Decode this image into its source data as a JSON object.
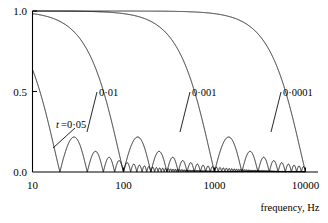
{
  "chart_data": {
    "type": "line",
    "title": "",
    "subtitle": "",
    "xlabel": "frequency, Hz",
    "ylabel": "",
    "xscale": "log",
    "xlim": [
      10,
      10000
    ],
    "ylim": [
      0.0,
      1.0
    ],
    "grid": false,
    "legend_position": "inline-annotations",
    "x_tick_labels": [
      "10",
      "100",
      "1000",
      "10000"
    ],
    "x_tick_values": [
      10,
      100,
      1000,
      10000
    ],
    "y_tick_labels": [
      "0.0",
      "0.5",
      "1.0"
    ],
    "y_tick_values": [
      0.0,
      0.5,
      1.0
    ],
    "annotations": [
      {
        "text": "t =0·05",
        "x": 30,
        "y": 0.3,
        "series": "0.05",
        "italic_prefix": "t"
      },
      {
        "text": "0·01",
        "x": 115,
        "y": 0.49,
        "series": "0.01"
      },
      {
        "text": "0·001",
        "x": 950,
        "y": 0.49,
        "series": "0.001"
      },
      {
        "text": "0·0001",
        "x": 8500,
        "y": 0.49,
        "series": "0.0001"
      }
    ],
    "series": [
      {
        "name": "0·05",
        "label": "t =0·05",
        "t_seconds": 0.05,
        "first_zero_hz": 20,
        "color": "#000000",
        "x": [
          10,
          12,
          14,
          16,
          18,
          20,
          24,
          28,
          30,
          34,
          38,
          40,
          46,
          50,
          56,
          60,
          66,
          70,
          76,
          80,
          90,
          100,
          110,
          120,
          140,
          160,
          180,
          200,
          250,
          300,
          400,
          500,
          700,
          1000,
          1500,
          2000,
          3000,
          5000,
          7000,
          10000
        ],
        "y": [
          0.935,
          0.766,
          0.573,
          0.368,
          0.175,
          0.0,
          0.212,
          0.284,
          0.3,
          0.245,
          0.118,
          0.0,
          0.125,
          0.167,
          0.131,
          0.0,
          0.085,
          0.11,
          0.092,
          0.0,
          0.084,
          0.0,
          0.068,
          0.0,
          0.059,
          0.0,
          0.052,
          0.0,
          0.042,
          0.0,
          0.032,
          0.0,
          0.023,
          0.0,
          0.015,
          0.0,
          0.011,
          0.0,
          0.0075,
          0.0
        ]
      },
      {
        "name": "0·01",
        "label": "0·01",
        "t_seconds": 0.01,
        "first_zero_hz": 100,
        "color": "#000000",
        "x": [
          10,
          14,
          20,
          28,
          40,
          55,
          70,
          80,
          90,
          95,
          100,
          120,
          150,
          200,
          250,
          300,
          400,
          500,
          700,
          1000,
          1500,
          2000,
          3000,
          5000,
          7000,
          10000
        ],
        "y": [
          0.984,
          0.968,
          0.935,
          0.874,
          0.757,
          0.572,
          0.368,
          0.234,
          0.109,
          0.049,
          0.0,
          0.156,
          0.212,
          0.0,
          0.127,
          0.0,
          0.075,
          0.0,
          0.045,
          0.0,
          0.021,
          0.0,
          0.011,
          0.0,
          0.0045,
          0.0
        ]
      },
      {
        "name": "0·001",
        "label": "0·001",
        "t_seconds": 0.001,
        "first_zero_hz": 1000,
        "color": "#000000",
        "x": [
          10,
          50,
          100,
          200,
          300,
          400,
          500,
          600,
          700,
          800,
          900,
          950,
          1000,
          1200,
          1500,
          2000,
          2500,
          3000,
          4000,
          5000,
          7000,
          10000
        ],
        "y": [
          0.9998,
          0.996,
          0.984,
          0.935,
          0.858,
          0.757,
          0.637,
          0.505,
          0.368,
          0.234,
          0.109,
          0.052,
          0.0,
          0.156,
          0.212,
          0.0,
          0.128,
          0.0,
          0.075,
          0.0,
          0.031,
          0.0
        ]
      },
      {
        "name": "0·0001",
        "label": "0·0001",
        "t_seconds": 0.0001,
        "first_zero_hz": 10000,
        "color": "#000000",
        "x": [
          10,
          100,
          500,
          1000,
          2000,
          3000,
          4000,
          5000,
          6000,
          7000,
          8000,
          9000,
          9500,
          10000
        ],
        "y": [
          1.0,
          0.9998,
          0.996,
          0.984,
          0.935,
          0.858,
          0.757,
          0.637,
          0.505,
          0.368,
          0.234,
          0.109,
          0.052,
          0.0
        ]
      }
    ]
  },
  "axes": {
    "x_title": "frequency, Hz",
    "x_ticks": [
      "10",
      "100",
      "1000",
      "10000"
    ],
    "y_ticks": [
      "0.0",
      "0.5",
      "1.0"
    ]
  },
  "labels": {
    "curve_1": "t =0·05",
    "curve_1_italic": "t",
    "curve_1_rest": " =0·05",
    "curve_2": "0·01",
    "curve_3": "0·001",
    "curve_4": "0·0001"
  },
  "colors": {
    "background": "#ffffff",
    "ink": "#000000",
    "axis": "#000000"
  }
}
